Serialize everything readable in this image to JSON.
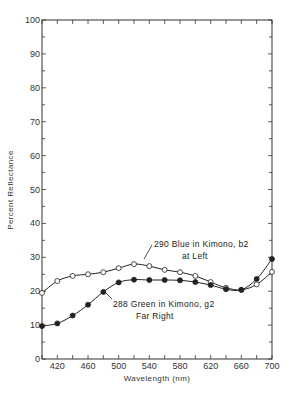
{
  "chart_data": {
    "type": "line",
    "title": "",
    "xlabel": "Wavelength (nm)",
    "ylabel": "Percent Reflectance",
    "xlim": [
      400,
      700
    ],
    "ylim": [
      0,
      100
    ],
    "grid": false,
    "x": [
      400,
      420,
      440,
      460,
      480,
      500,
      520,
      540,
      560,
      580,
      600,
      620,
      640,
      660,
      680,
      700
    ],
    "x_tick_labels": [
      "420",
      "460",
      "500",
      "540",
      "580",
      "620",
      "660",
      "700"
    ],
    "x_tick_values": [
      420,
      460,
      500,
      540,
      580,
      620,
      660,
      700
    ],
    "y_tick_labels": [
      "0",
      "10",
      "20",
      "30",
      "40",
      "50",
      "60",
      "70",
      "80",
      "90",
      "100"
    ],
    "series": [
      {
        "name": "290 Blue in Kimono, b2 at Left",
        "marker": "open-circle",
        "values": [
          19.5,
          23.0,
          24.5,
          25.0,
          25.6,
          26.8,
          28.0,
          27.4,
          26.3,
          25.6,
          24.5,
          22.7,
          21.0,
          20.4,
          22.0,
          25.7
        ]
      },
      {
        "name": "288 Green in Kimono, g2 Far Right",
        "marker": "filled-circle",
        "values": [
          9.7,
          10.5,
          12.8,
          16.0,
          19.8,
          22.6,
          23.4,
          23.3,
          23.3,
          23.2,
          22.7,
          21.8,
          20.6,
          20.4,
          23.6,
          29.5
        ]
      }
    ],
    "annotations": [
      {
        "line1": "290 Blue in Kimono, b2",
        "line2": "at Left",
        "points_to": "open-circle series near 530 nm"
      },
      {
        "line1": "288 Green in Kimono, g2",
        "line2": "Far Right",
        "points_to": "filled-circle series near 480 nm"
      }
    ]
  },
  "labels": {
    "ylabel": "Percent Reflectance",
    "xlabel": "Wavelength (nm)",
    "blue_line1": "290 Blue in Kimono, b2",
    "blue_line2": "at Left",
    "green_line1": "288 Green in Kimono, g2",
    "green_line2": "Far Right"
  },
  "colors": {
    "axis": "#333333",
    "line": "#222222",
    "background": "#ffffff"
  }
}
